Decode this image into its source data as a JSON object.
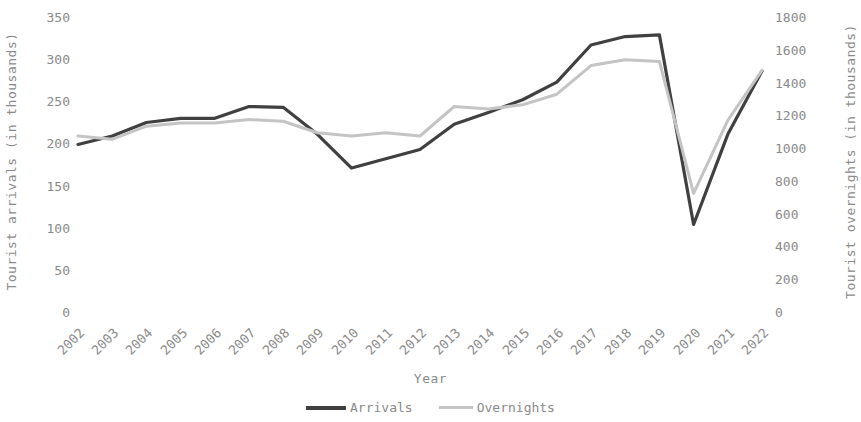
{
  "chart_data": {
    "type": "line",
    "title": "",
    "xlabel": "Year",
    "ylabel": "Tourist arrivals (in thousands)",
    "y2label": "Tourist overnights (in thousands)",
    "categories": [
      2002,
      2003,
      2004,
      2005,
      2006,
      2007,
      2008,
      2009,
      2010,
      2011,
      2012,
      2013,
      2014,
      2015,
      2016,
      2017,
      2018,
      2019,
      2020,
      2021,
      2022
    ],
    "xtick_labels": [
      "2002",
      "2003",
      "2004",
      "2005",
      "2006",
      "2007",
      "2008",
      "2009",
      "2010",
      "2011",
      "2012",
      "2013",
      "2014",
      "2015",
      "2016",
      "2017",
      "2018",
      "2019",
      "2020",
      "2021",
      "2022"
    ],
    "ylim": [
      0,
      350
    ],
    "y2lim": [
      0,
      1800
    ],
    "ytick_labels": [
      "350",
      "300",
      "250",
      "200",
      "150",
      "100",
      "50",
      "0"
    ],
    "yticks": [
      350,
      300,
      250,
      200,
      150,
      100,
      50,
      0
    ],
    "y2tick_labels": [
      "1800",
      "1600",
      "1400",
      "1200",
      "1000",
      "800",
      "600",
      "400",
      "200",
      "0"
    ],
    "y2ticks": [
      1800,
      1600,
      1400,
      1200,
      1000,
      800,
      600,
      400,
      200,
      0
    ],
    "grid": false,
    "legend_position": "bottom-center",
    "series": [
      {
        "name": "Arrivals",
        "axis": "left",
        "color": "#404040",
        "width": 3.2,
        "values": [
          200,
          210,
          226,
          231,
          231,
          245,
          244,
          212,
          172,
          183,
          194,
          224,
          238,
          253,
          274,
          318,
          328,
          330,
          105,
          212,
          287
        ]
      },
      {
        "name": "Overnights",
        "axis": "right",
        "color": "#c4c4c4",
        "width": 3.0,
        "values": [
          1080,
          1060,
          1140,
          1160,
          1160,
          1180,
          1170,
          1100,
          1080,
          1100,
          1080,
          1260,
          1245,
          1270,
          1335,
          1510,
          1545,
          1535,
          730,
          1175,
          1480
        ]
      }
    ],
    "legend": [
      {
        "label": "Arrivals",
        "color": "#404040",
        "style": "thick"
      },
      {
        "label": "Overnights",
        "color": "#c4c4c4",
        "style": "thin"
      }
    ]
  }
}
